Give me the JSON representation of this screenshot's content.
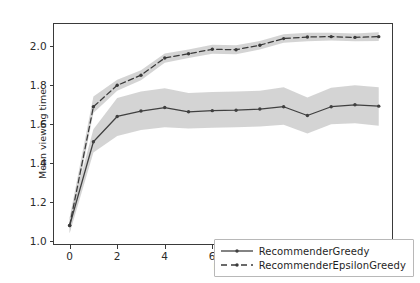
{
  "chart_data": {
    "type": "line",
    "title": "",
    "xlabel": "Day",
    "ylabel": "Mean viewing time",
    "xlim": [
      -0.7,
      13.6
    ],
    "ylim": [
      0.98,
      2.12
    ],
    "grid": false,
    "legend_position": "lower right",
    "x": [
      0,
      1,
      2,
      3,
      4,
      5,
      6,
      7,
      8,
      9,
      10,
      11,
      12,
      13
    ],
    "xticks": [
      0,
      2,
      4,
      6,
      8,
      10,
      12
    ],
    "xtick_labels": [
      "0",
      "2",
      "4",
      "6",
      "8",
      "10",
      "12"
    ],
    "yticks": [
      1.0,
      1.2,
      1.4,
      1.6,
      1.8,
      2.0
    ],
    "ytick_labels": [
      "1.0",
      "1.2",
      "1.4",
      "1.6",
      "1.8",
      "2.0"
    ],
    "series": [
      {
        "name": "RecommenderGreedy",
        "style": "solid",
        "marker": "dot",
        "color": "#404040",
        "band_color": "#c4c4c4",
        "values": [
          1.08,
          1.51,
          1.64,
          1.668,
          1.686,
          1.664,
          1.67,
          1.672,
          1.678,
          1.69,
          1.645,
          1.69,
          1.7,
          1.693
        ],
        "band_lower": [
          1.04,
          1.455,
          1.54,
          1.57,
          1.585,
          1.578,
          1.582,
          1.585,
          1.588,
          1.598,
          1.553,
          1.6,
          1.605,
          1.592
        ],
        "band_upper": [
          1.12,
          1.575,
          1.735,
          1.768,
          1.785,
          1.76,
          1.766,
          1.768,
          1.772,
          1.79,
          1.738,
          1.788,
          1.8,
          1.79
        ]
      },
      {
        "name": "RecommenderEpsilonGreedy",
        "style": "dashed",
        "marker": "dot",
        "color": "#3a3a3a",
        "band_color": "#c4c4c4",
        "values": [
          1.08,
          1.69,
          1.8,
          1.852,
          1.94,
          1.962,
          1.985,
          1.983,
          2.006,
          2.04,
          2.048,
          2.05,
          2.046,
          2.05
        ],
        "band_lower": [
          1.04,
          1.658,
          1.772,
          1.826,
          1.916,
          1.94,
          1.962,
          1.96,
          1.984,
          2.018,
          2.026,
          2.03,
          2.026,
          2.028
        ],
        "band_upper": [
          1.12,
          1.742,
          1.828,
          1.878,
          1.964,
          1.984,
          2.008,
          2.006,
          2.028,
          2.062,
          2.07,
          2.07,
          2.066,
          2.072
        ]
      }
    ]
  },
  "legend": {
    "items": [
      {
        "label": "RecommenderGreedy"
      },
      {
        "label": "RecommenderEpsilonGreedy"
      }
    ]
  }
}
